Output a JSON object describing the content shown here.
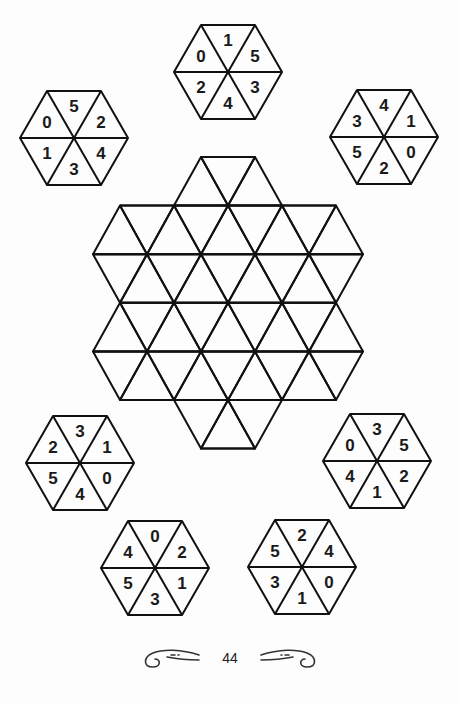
{
  "puzzle": {
    "hexagons": [
      {
        "id": "top",
        "cx": 228,
        "cy": 72,
        "labels": [
          "0",
          "1",
          "5",
          "2",
          "4",
          "3"
        ]
      },
      {
        "id": "upper-left",
        "cx": 74,
        "cy": 138,
        "labels": [
          "0",
          "5",
          "2",
          "1",
          "3",
          "4"
        ]
      },
      {
        "id": "upper-right",
        "cx": 384,
        "cy": 137,
        "labels": [
          "3",
          "4",
          "1",
          "5",
          "2",
          "0"
        ]
      },
      {
        "id": "lower-left",
        "cx": 80,
        "cy": 463,
        "labels": [
          "2",
          "3",
          "1",
          "5",
          "4",
          "0"
        ]
      },
      {
        "id": "lower-right",
        "cx": 377,
        "cy": 461,
        "labels": [
          "0",
          "3",
          "5",
          "4",
          "1",
          "2"
        ]
      },
      {
        "id": "bottom-left",
        "cx": 155,
        "cy": 568,
        "labels": [
          "4",
          "0",
          "2",
          "5",
          "3",
          "1"
        ]
      },
      {
        "id": "bottom-right",
        "cx": 302,
        "cy": 567,
        "labels": [
          "5",
          "2",
          "4",
          "3",
          "1",
          "0"
        ]
      }
    ],
    "label_order": [
      "upper-left",
      "top",
      "upper-right",
      "lower-left",
      "bottom",
      "lower-right"
    ],
    "central_grid": {
      "description": "Star-shaped grid of equilateral triangles (hexagon of 6 small hexagons around center, with extra top and bottom triangles)",
      "unit": 54,
      "row_height": 48.6,
      "origin_x": 228,
      "top_y": 157
    }
  },
  "footer": {
    "page_number": "44"
  }
}
